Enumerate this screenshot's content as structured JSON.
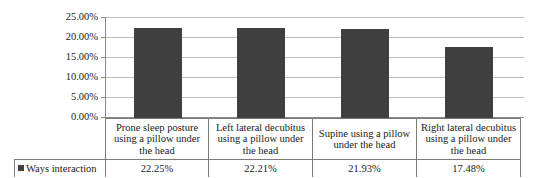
{
  "chart_data": {
    "type": "bar",
    "title": "",
    "subtitle": "",
    "xlabel": "",
    "ylabel": "",
    "categories": [
      "Prone sleep posture using a pillow under the head",
      "Left lateral decubitus using a pillow under the head",
      "Supine using a pillow under the head",
      "Right lateral decubitus using a pillow under the head"
    ],
    "series": [
      {
        "name": "Ways interaction",
        "values": [
          22.25,
          22.21,
          21.93,
          17.48
        ],
        "value_labels": [
          "22.25%",
          "22.21%",
          "21.93%",
          "17.48%"
        ],
        "color": "#404040"
      }
    ],
    "ylim": [
      0,
      25
    ],
    "ytick_values": [
      25,
      20,
      15,
      10,
      5,
      0
    ],
    "ytick_labels": [
      "25.00%",
      "20.00%",
      "15.00%",
      "10.00%",
      "5.00%",
      "0.00%"
    ],
    "grid": true,
    "grid_axis": "y",
    "legend_position": "data-table-row",
    "data_table_visible": true,
    "axis_labels_visible": false
  },
  "legend": {
    "swatch_name": "series-color-swatch",
    "label": "Ways interaction"
  },
  "colors": {
    "bar": "#404040",
    "gridline": "#bfbfbf",
    "axis": "#8a8a8a",
    "table_border": "#7a7a7a",
    "background": "#ffffff",
    "text": "#1a1a1a"
  }
}
